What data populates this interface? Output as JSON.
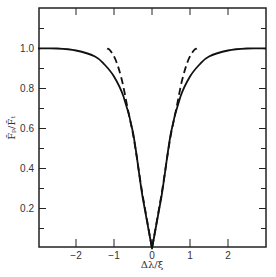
{
  "chart_data": {
    "type": "line",
    "title": "",
    "xlabel": "Δλ/ξ",
    "ylabel": "F̄ₚ/F̄ₜ",
    "xlim": [
      -3,
      3.1
    ],
    "ylim": [
      0,
      1.2
    ],
    "grid": false,
    "legend": null,
    "x_ticks": [
      -2,
      -1,
      0,
      1,
      2
    ],
    "x_tick_labels": [
      "−2",
      "−1",
      "0",
      "1",
      "2"
    ],
    "y_ticks": [
      0.2,
      0.4,
      0.6,
      0.8,
      1.0
    ],
    "y_tick_labels": [
      "0.2",
      "0.4",
      "0.6",
      "0.8",
      "1.0"
    ],
    "y_minor_ticks": [
      0.1,
      0.3,
      0.5,
      0.7,
      0.9,
      1.1
    ],
    "series": [
      {
        "name": "solid",
        "style": "solid",
        "color": "#111111",
        "x": [
          -3.0,
          -2.5,
          -2.0,
          -1.5,
          -1.25,
          -1.0,
          -0.75,
          -0.5,
          -0.25,
          0.0,
          0.25,
          0.5,
          0.75,
          1.0,
          1.25,
          1.5,
          2.0,
          2.5,
          3.0
        ],
        "y": [
          1.0,
          1.0,
          0.99,
          0.96,
          0.92,
          0.86,
          0.76,
          0.58,
          0.26,
          0.0,
          0.26,
          0.58,
          0.76,
          0.86,
          0.92,
          0.96,
          0.99,
          1.0,
          1.0
        ]
      },
      {
        "name": "dashed",
        "style": "dashed",
        "color": "#111111",
        "x": [
          -1.18,
          -1.1,
          -0.95,
          -0.79,
          -0.63,
          -0.47,
          -0.25,
          0.0,
          0.25,
          0.47,
          0.63,
          0.79,
          0.95,
          1.1,
          1.18
        ],
        "y": [
          1.0,
          0.99,
          0.94,
          0.84,
          0.69,
          0.54,
          0.27,
          0.0,
          0.27,
          0.54,
          0.69,
          0.84,
          0.94,
          0.99,
          1.0
        ]
      }
    ]
  }
}
